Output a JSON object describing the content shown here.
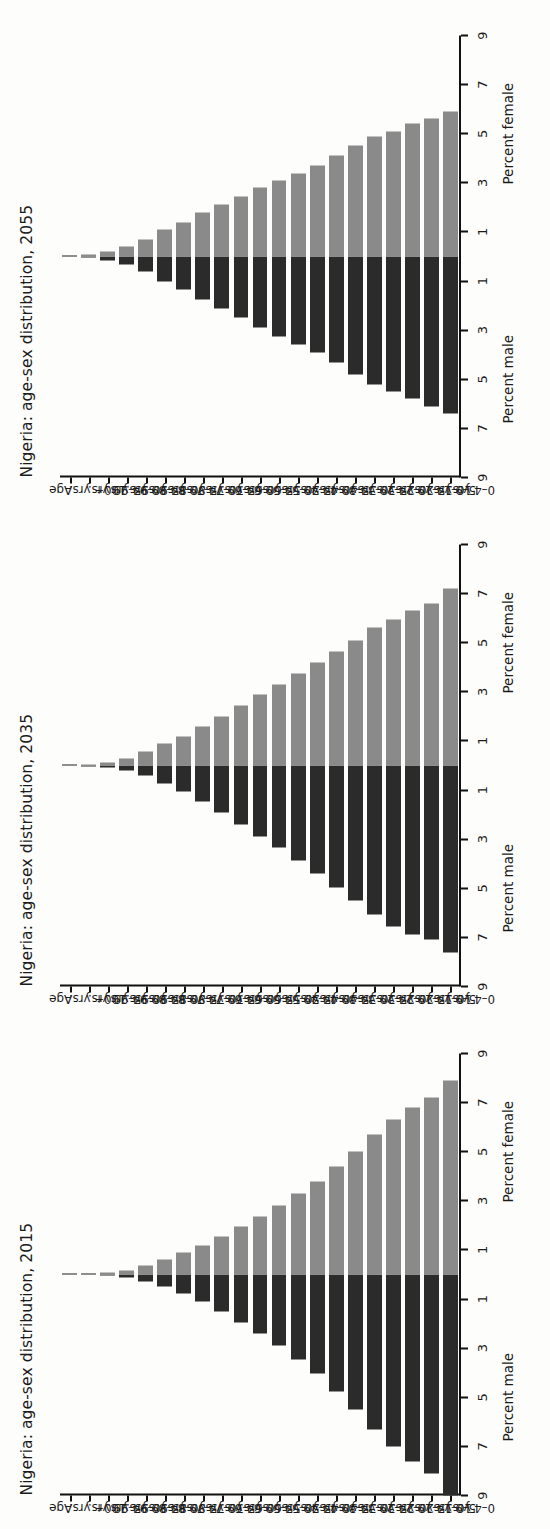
{
  "figure": {
    "panel_count": 3
  },
  "axis": {
    "age_caption": "Age",
    "male_label": "Percent male",
    "female_label": "Percent female",
    "ticks": [
      "9",
      "7",
      "5",
      "3",
      "1",
      "1",
      "3",
      "5",
      "7",
      "9"
    ],
    "tick_values": [
      -9,
      -7,
      -5,
      -3,
      -1,
      1,
      3,
      5,
      7,
      9
    ],
    "limit": 9,
    "age_groups": [
      "100+ yrs.",
      "95–99 yrs.",
      "90–94 yrs.",
      "85–89 yrs.",
      "80–84 yrs.",
      "75–79 yrs.",
      "70–74 yrs.",
      "65–69 yrs.",
      "60–64 yrs.",
      "55–59 yrs.",
      "50–54 yrs.",
      "45–49 yrs.",
      "40–44 yrs.",
      "35–39 yrs.",
      "30–34 yrs.",
      "25–29 yrs.",
      "20–24 yrs.",
      "15–19 yrs.",
      "10–14 yrs.",
      "5–9 yrs.",
      "0–4 yrs."
    ]
  },
  "colors": {
    "male": "#2b2b2b",
    "female": "#8a8a8a",
    "axis": "#111111",
    "background": "#fdfdfb"
  },
  "chart_data": [
    {
      "type": "bar",
      "title": "Nigeria: age-sex distribution, 2055",
      "xlabel": "Percent male / Percent female",
      "ylabel": "Age",
      "xlim": [
        -9,
        9
      ],
      "grid": false,
      "legend": "none",
      "categories": [
        "100+ yrs.",
        "95–99 yrs.",
        "90–94 yrs.",
        "85–89 yrs.",
        "80–84 yrs.",
        "75–79 yrs.",
        "70–74 yrs.",
        "65–69 yrs.",
        "60–64 yrs.",
        "55–59 yrs.",
        "50–54 yrs.",
        "45–49 yrs.",
        "40–44 yrs.",
        "35–39 yrs.",
        "30–34 yrs.",
        "25–29 yrs.",
        "20–24 yrs.",
        "15–19 yrs.",
        "10–14 yrs.",
        "5–9 yrs.",
        "0–4 yrs."
      ],
      "series": [
        {
          "name": "Percent male",
          "values": [
            0.02,
            0.06,
            0.15,
            0.32,
            0.6,
            1.0,
            1.35,
            1.75,
            2.1,
            2.5,
            2.9,
            3.25,
            3.6,
            3.9,
            4.3,
            4.8,
            5.2,
            5.5,
            5.8,
            6.1,
            6.4
          ]
        },
        {
          "name": "Percent female",
          "values": [
            0.03,
            0.08,
            0.2,
            0.4,
            0.7,
            1.1,
            1.4,
            1.8,
            2.1,
            2.45,
            2.8,
            3.1,
            3.4,
            3.7,
            4.1,
            4.5,
            4.9,
            5.1,
            5.4,
            5.6,
            5.9
          ]
        }
      ]
    },
    {
      "type": "bar",
      "title": "Nigeria: age-sex distribution, 2035",
      "xlabel": "Percent male / Percent female",
      "ylabel": "Age",
      "xlim": [
        -9,
        9
      ],
      "grid": false,
      "legend": "none",
      "categories": [
        "100+ yrs.",
        "95–99 yrs.",
        "90–94 yrs.",
        "85–89 yrs.",
        "80–84 yrs.",
        "75–79 yrs.",
        "70–74 yrs.",
        "65–69 yrs.",
        "60–64 yrs.",
        "55–59 yrs.",
        "50–54 yrs.",
        "45–49 yrs.",
        "40–44 yrs.",
        "35–39 yrs.",
        "30–34 yrs.",
        "25–29 yrs.",
        "20–24 yrs.",
        "15–19 yrs.",
        "10–14 yrs.",
        "5–9 yrs.",
        "0–4 yrs."
      ],
      "series": [
        {
          "name": "Percent male",
          "values": [
            0.01,
            0.03,
            0.08,
            0.2,
            0.42,
            0.72,
            1.05,
            1.45,
            1.9,
            2.4,
            2.9,
            3.35,
            3.85,
            4.4,
            4.95,
            5.5,
            6.05,
            6.55,
            6.9,
            7.1,
            7.6
          ]
        },
        {
          "name": "Percent female",
          "values": [
            0.02,
            0.05,
            0.12,
            0.28,
            0.55,
            0.88,
            1.2,
            1.6,
            2.0,
            2.45,
            2.9,
            3.3,
            3.75,
            4.2,
            4.65,
            5.1,
            5.6,
            5.95,
            6.3,
            6.6,
            7.2
          ]
        }
      ]
    },
    {
      "type": "bar",
      "title": "Nigeria: age-sex distribution, 2015",
      "xlabel": "Percent male / Percent female",
      "ylabel": "Age",
      "xlim": [
        -9,
        9
      ],
      "grid": false,
      "legend": "none",
      "categories": [
        "100+ yrs.",
        "95–99 yrs.",
        "90–94 yrs.",
        "85–89 yrs.",
        "80–84 yrs.",
        "75–79 yrs.",
        "70–74 yrs.",
        "65–69 yrs.",
        "60–64 yrs.",
        "55–59 yrs.",
        "50–54 yrs.",
        "45–49 yrs.",
        "40–44 yrs.",
        "35–39 yrs.",
        "30–34 yrs.",
        "25–29 yrs.",
        "20–24 yrs.",
        "15–19 yrs.",
        "10–14 yrs.",
        "5–9 yrs.",
        "0–4 yrs."
      ],
      "series": [
        {
          "name": "Percent male",
          "values": [
            0.01,
            0.02,
            0.05,
            0.12,
            0.28,
            0.5,
            0.78,
            1.1,
            1.5,
            1.95,
            2.4,
            2.9,
            3.45,
            4.05,
            4.75,
            5.5,
            6.3,
            7.0,
            7.6,
            8.1,
            9.0
          ]
        },
        {
          "name": "Percent female",
          "values": [
            0.01,
            0.03,
            0.07,
            0.16,
            0.35,
            0.6,
            0.9,
            1.2,
            1.55,
            1.95,
            2.35,
            2.8,
            3.3,
            3.8,
            4.4,
            5.0,
            5.7,
            6.3,
            6.8,
            7.2,
            7.9
          ]
        }
      ]
    }
  ]
}
